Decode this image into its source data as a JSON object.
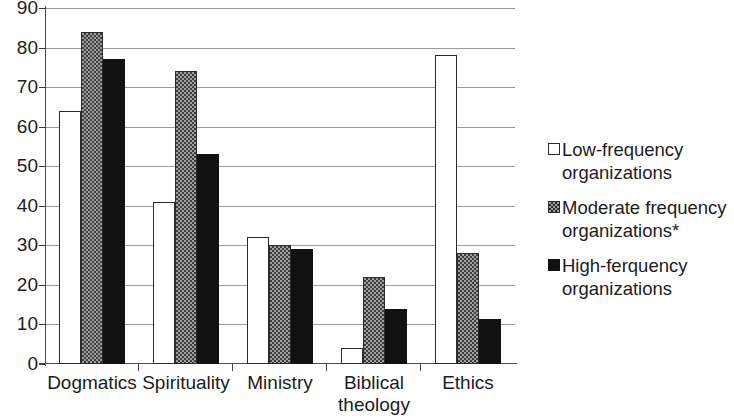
{
  "chart_data": {
    "type": "bar",
    "title": "",
    "subtitle": "",
    "xlabel": "",
    "ylabel": "",
    "ylim": [
      0,
      90
    ],
    "ytick_step": 10,
    "yticks": [
      90,
      80,
      70,
      60,
      50,
      40,
      30,
      20,
      10,
      0
    ],
    "grid": true,
    "legend_position": "right",
    "categories": [
      "Dogmatics",
      "Spirituality",
      "Ministry",
      "Biblical theology",
      "Ethics"
    ],
    "category_lines": [
      [
        "Dogmatics"
      ],
      [
        "Spirituality"
      ],
      [
        "Ministry"
      ],
      [
        "Biblical",
        "theology"
      ],
      [
        "Ethics"
      ]
    ],
    "series": [
      {
        "name": "Low-frequency organizations",
        "key": "low",
        "fill": "white",
        "color": "#ffffff",
        "values": [
          64,
          41,
          32,
          4,
          78
        ]
      },
      {
        "name": "Moderate frequency organizations*",
        "key": "moderate",
        "fill": "checkered-gray",
        "color": "#9e9e9e",
        "values": [
          84,
          74,
          30,
          22,
          28
        ]
      },
      {
        "name": "High-ferquency organizations",
        "key": "high",
        "fill": "solid-black",
        "color": "#111111",
        "values": [
          77,
          53,
          29,
          14,
          11.5
        ]
      }
    ]
  },
  "legend": {
    "items": [
      {
        "label": "Low-frequency organizations",
        "swatch": "white-square-icon"
      },
      {
        "label": "Moderate frequency organizations*",
        "swatch": "checkered-square-icon"
      },
      {
        "label": "High-ferquency organizations",
        "swatch": "black-square-icon"
      }
    ]
  }
}
